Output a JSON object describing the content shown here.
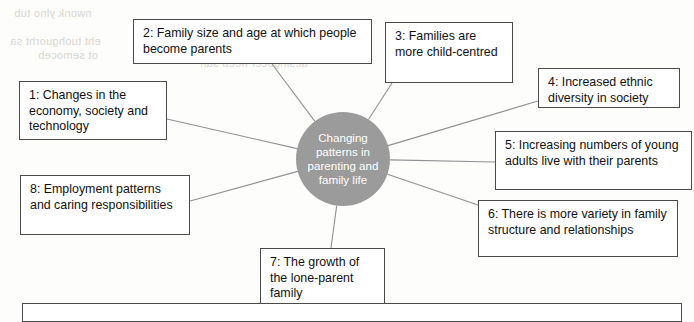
{
  "diagram": {
    "type": "spoke-hub-mind-map",
    "hub": {
      "label": "Changing patterns in parenting and family life",
      "fill_color": "#9b9b9b",
      "text_color": "#ffffff",
      "cx": 343,
      "cy": 159,
      "r": 47
    },
    "connector_color": "#8f9295",
    "box_border_color": "#4a4a4a",
    "box_fill_color": "#ffffff",
    "nodes": [
      {
        "number": "1",
        "label": "1: Changes in the economy, society and technology",
        "x": 19,
        "y": 81,
        "w": 148,
        "h": 59,
        "anchor_x": 167,
        "anchor_y": 119
      },
      {
        "number": "2",
        "label": "2: Family size and age at which people become parents",
        "x": 133,
        "y": 19,
        "w": 239,
        "h": 45,
        "anchor_x": 272,
        "anchor_y": 64
      },
      {
        "number": "3",
        "label": "3: Families are more child-centred",
        "x": 385,
        "y": 22,
        "w": 128,
        "h": 61,
        "anchor_x": 392,
        "anchor_y": 83
      },
      {
        "number": "4",
        "label": "4: Increased ethnic diversity in society",
        "x": 538,
        "y": 68,
        "w": 142,
        "h": 40,
        "anchor_x": 538,
        "anchor_y": 101
      },
      {
        "number": "5",
        "label": "5: Increasing numbers of young adults live with their parents",
        "x": 495,
        "y": 131,
        "w": 197,
        "h": 59,
        "anchor_x": 495,
        "anchor_y": 162
      },
      {
        "number": "6",
        "label": "6: There is more variety in family structure and relationships",
        "x": 478,
        "y": 200,
        "w": 200,
        "h": 57,
        "anchor_x": 478,
        "anchor_y": 205
      },
      {
        "number": "7",
        "label": "7: The growth of the lone-parent family",
        "x": 260,
        "y": 248,
        "w": 125,
        "h": 58,
        "anchor_x": 331,
        "anchor_y": 248
      },
      {
        "number": "8",
        "label": "8: Employment patterns and caring responsibilities",
        "x": 20,
        "y": 175,
        "w": 170,
        "h": 60,
        "anchor_x": 190,
        "anchor_y": 201
      }
    ],
    "footer_box": {
      "x": 22,
      "y": 303,
      "w": 660,
      "h": 19,
      "label": ""
    },
    "showthrough_lines": [
      {
        "text": "nwonk ylno tub",
        "x": 14,
        "y": 6
      },
      {
        "text": "eht tuohguorht sa",
        "x": 10,
        "y": 34
      },
      {
        "text": "ot semoceb",
        "x": 38,
        "y": 48
      },
      {
        "text": "dnuorgkcab",
        "x": 176,
        "y": 16
      },
      {
        "text": "desingocer neeb sah",
        "x": 200,
        "y": 56
      }
    ]
  }
}
